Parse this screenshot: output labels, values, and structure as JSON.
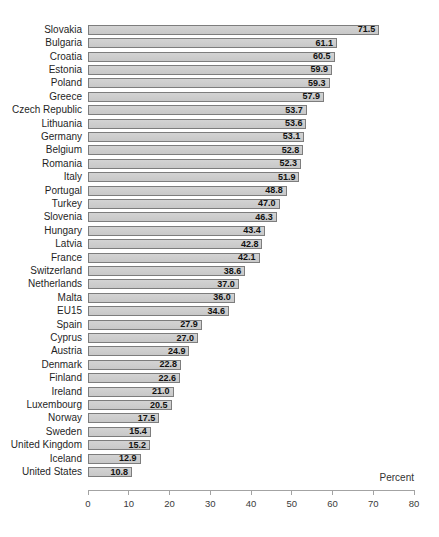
{
  "chart_data": {
    "type": "bar",
    "orientation": "horizontal",
    "title": "",
    "xlabel": "Percent",
    "ylabel": "",
    "xlim": [
      0,
      80
    ],
    "xticks": [
      0,
      10,
      20,
      30,
      40,
      50,
      60,
      70,
      80
    ],
    "grid": false,
    "value_label_position": "inside-end",
    "categories": [
      "Slovakia",
      "Bulgaria",
      "Croatia",
      "Estonia",
      "Poland",
      "Greece",
      "Czech Republic",
      "Lithuania",
      "Germany",
      "Belgium",
      "Romania",
      "Italy",
      "Portugal",
      "Turkey",
      "Slovenia",
      "Hungary",
      "Latvia",
      "France",
      "Switzerland",
      "Netherlands",
      "Malta",
      "EU15",
      "Spain",
      "Cyprus",
      "Austria",
      "Denmark",
      "Finland",
      "Ireland",
      "Luxembourg",
      "Norway",
      "Sweden",
      "United Kingdom",
      "Iceland",
      "United States"
    ],
    "values": [
      71.5,
      61.1,
      60.5,
      59.9,
      59.3,
      57.9,
      53.7,
      53.6,
      53.1,
      52.8,
      52.3,
      51.9,
      48.8,
      47.0,
      46.3,
      43.4,
      42.8,
      42.1,
      38.6,
      37.0,
      36.0,
      34.6,
      27.9,
      27.0,
      24.9,
      22.8,
      22.6,
      21.0,
      20.5,
      17.5,
      15.4,
      15.2,
      12.9,
      10.8
    ],
    "colors": {
      "bar_fill": "#c8c8c8",
      "bar_border": "#7d7d7d",
      "axis": "#a3a3a3",
      "label_text": "#1f1f1f",
      "value_text": "#111111",
      "background": "#ffffff"
    }
  }
}
